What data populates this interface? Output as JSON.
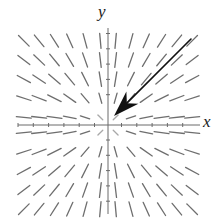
{
  "figure": {
    "kind": "direction-field",
    "width": 223,
    "height": 221,
    "background": "#ffffff"
  },
  "axes": {
    "x_label": "x",
    "y_label": "y",
    "color": "#6b6b6b",
    "origin_px": {
      "x": 108,
      "y": 125
    },
    "x_axis_px": {
      "x1": 18,
      "x2": 200,
      "y": 125
    },
    "y_axis_px": {
      "x": 108,
      "y1": 28,
      "y2": 214
    },
    "tick_spacing_px": 15.3,
    "tick_length_px": 4,
    "x_ticks_px": [
      18.0,
      33.3,
      48.6,
      63.9,
      79.2,
      94.5,
      121.5,
      136.8,
      152.1,
      167.4,
      182.7
    ],
    "y_ticks_px": [
      33.5,
      48.8,
      64.1,
      79.4,
      94.7,
      140.0,
      155.3,
      170.6,
      185.9,
      201.2
    ]
  },
  "chart_data": {
    "type": "scatter",
    "title": "",
    "xlabel": "x",
    "ylabel": "y",
    "equation": "dy/dx = y/x",
    "grid": false,
    "legend": false,
    "xlim": [
      -6,
      6
    ],
    "ylim": [
      -6,
      6
    ],
    "grid_columns": [
      -5.5,
      -4.5,
      -3.5,
      -2.5,
      -1.5,
      -0.5,
      0.5,
      1.5,
      2.5,
      3.5,
      4.5,
      5.5
    ],
    "grid_rows": [
      5.5,
      4.25,
      3.0,
      1.75,
      0.5,
      -0.5,
      -1.75,
      -3.0,
      -4.25,
      -5.5
    ],
    "segment": {
      "color": "#626262",
      "width_px": 1.3,
      "length_px": 15,
      "count": 120
    },
    "trajectory_arrow": {
      "from_px": {
        "x": 191,
        "y": 39
      },
      "to_px": {
        "x": 114,
        "y": 116
      },
      "from_data": {
        "x": 5.4,
        "y": 5.6
      },
      "to_data": {
        "x": 0.4,
        "y": 0.6
      },
      "direction": "toward-origin",
      "color": "#111111",
      "line_width_px": 1.6,
      "head_length_px": 26,
      "head_width_px": 17
    }
  }
}
